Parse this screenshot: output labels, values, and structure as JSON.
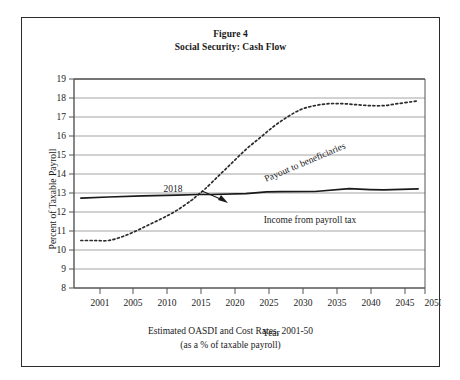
{
  "figure": {
    "title_line1": "Figure 4",
    "title_line2": "Social Security: Cash Flow",
    "caption_line1": "Estimated OASDI and Cost Rates, 2001-50",
    "caption_line2": "(as a % of taxable payroll)"
  },
  "chart_data": {
    "type": "line",
    "title": "Social Security: Cash Flow",
    "subtitle": "Figure 4",
    "xlabel": "Year",
    "ylabel": "Percent of Taxable Payroll",
    "xlim": [
      2000,
      2051
    ],
    "ylim": [
      8,
      19
    ],
    "xticks": [
      2001,
      2005,
      2010,
      2015,
      2020,
      2025,
      2030,
      2035,
      2040,
      2045,
      2050
    ],
    "xtick_labels": [
      "2001",
      "2005",
      "2010",
      "2015",
      "2020",
      "2025",
      "2030",
      "2035",
      "2040",
      "2045",
      "2050"
    ],
    "yticks": [
      8,
      9,
      10,
      11,
      12,
      13,
      14,
      15,
      16,
      17,
      18,
      19
    ],
    "ytick_labels": [
      "8",
      "9",
      "10",
      "11",
      "12",
      "13",
      "14",
      "15",
      "16",
      "17",
      "18",
      "19"
    ],
    "grid": "horizontal",
    "legend_position": "inline-annotation",
    "series": [
      {
        "name": "Payout to beneficiaries",
        "style": "dotted",
        "color": "#2b2b2b",
        "x": [
          2001,
          2003,
          2005,
          2007,
          2009,
          2011,
          2013,
          2015,
          2017,
          2018,
          2019,
          2021,
          2023,
          2025,
          2027,
          2029,
          2031,
          2033,
          2035,
          2037,
          2039,
          2041,
          2043,
          2045,
          2047,
          2049,
          2050
        ],
        "values": [
          10.5,
          10.5,
          10.5,
          10.7,
          11.0,
          11.35,
          11.7,
          12.1,
          12.6,
          12.9,
          13.2,
          13.9,
          14.6,
          15.3,
          15.9,
          16.5,
          17.0,
          17.4,
          17.6,
          17.7,
          17.7,
          17.65,
          17.6,
          17.6,
          17.7,
          17.8,
          17.85
        ]
      },
      {
        "name": "Income from payroll tax",
        "style": "solid",
        "color": "#1a1a1a",
        "x": [
          2001,
          2005,
          2010,
          2015,
          2018,
          2020,
          2025,
          2028,
          2030,
          2035,
          2040,
          2043,
          2045,
          2050
        ],
        "values": [
          12.73,
          12.79,
          12.85,
          12.89,
          12.92,
          12.92,
          12.97,
          13.06,
          13.07,
          13.08,
          13.23,
          13.18,
          13.16,
          13.22
        ]
      }
    ],
    "annotations": [
      {
        "text": "2018",
        "kind": "arrow-callout",
        "points_to": {
          "x": 2018,
          "y": 12.92
        },
        "label_at": {
          "x": 2012.5,
          "y": 13.55
        }
      },
      {
        "text": "Payout to beneficiaries",
        "kind": "rotated-series-label",
        "angle_deg": -23,
        "at": {
          "x": 2030,
          "y": 15.25
        }
      },
      {
        "text": "Income from payroll tax",
        "kind": "series-label",
        "at": {
          "x": 2033,
          "y": 12.28
        }
      }
    ]
  }
}
